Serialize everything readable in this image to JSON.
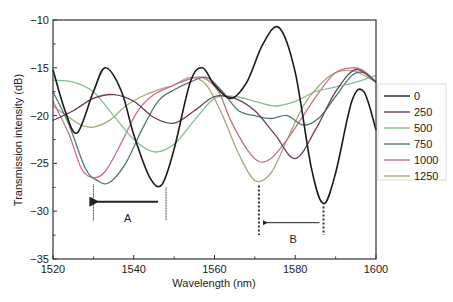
{
  "chart_data": {
    "type": "line",
    "title": "",
    "xlabel": "Wavelength (nm)",
    "ylabel": "Transmission intensity (dB)",
    "xlim": [
      1520,
      1600
    ],
    "ylim": [
      -35,
      -10
    ],
    "xticks": [
      1520,
      1540,
      1560,
      1580,
      1600
    ],
    "yticks": [
      -35,
      -30,
      -25,
      -20,
      -15,
      -10
    ],
    "grid": false,
    "legend_position": "right-outside",
    "series": [
      {
        "name": "0",
        "color": "#1a1a1a",
        "x": [
          1520,
          1523,
          1526,
          1530,
          1533,
          1537,
          1540,
          1544,
          1547,
          1550,
          1554,
          1557,
          1560,
          1564,
          1568,
          1572,
          1576,
          1580,
          1584,
          1587,
          1590,
          1594,
          1597,
          1600
        ],
        "y": [
          -15.2,
          -19.5,
          -21.8,
          -17.5,
          -15.0,
          -17.5,
          -22.0,
          -26.5,
          -27.2,
          -23.5,
          -16.5,
          -15.0,
          -16.8,
          -18.2,
          -16.5,
          -12.5,
          -10.8,
          -15.5,
          -25.5,
          -29.2,
          -26.0,
          -18.5,
          -17.5,
          -21.5
        ]
      },
      {
        "name": "250",
        "color": "#6b3a5c",
        "x": [
          1520,
          1525,
          1530,
          1535,
          1540,
          1545,
          1550,
          1555,
          1560,
          1565,
          1570,
          1575,
          1580,
          1585,
          1590,
          1595,
          1600
        ],
        "y": [
          -20.5,
          -19.5,
          -18.2,
          -17.8,
          -18.5,
          -20.2,
          -20.8,
          -19.5,
          -18.0,
          -18.2,
          -19.5,
          -22.0,
          -24.5,
          -21.5,
          -17.5,
          -15.2,
          -16.5
        ]
      },
      {
        "name": "500",
        "color": "#7fc090",
        "x": [
          1520,
          1525,
          1530,
          1535,
          1540,
          1545,
          1550,
          1555,
          1560,
          1565,
          1570,
          1575,
          1580,
          1585,
          1590,
          1595,
          1600
        ],
        "y": [
          -16.3,
          -16.5,
          -17.5,
          -20.0,
          -22.5,
          -23.8,
          -23.0,
          -20.5,
          -18.2,
          -18.0,
          -18.5,
          -19.0,
          -18.5,
          -17.5,
          -17.0,
          -16.5,
          -15.8
        ]
      },
      {
        "name": "750",
        "color": "#4e7a72",
        "x": [
          1520,
          1524,
          1528,
          1531,
          1534,
          1538,
          1542,
          1546,
          1550,
          1554,
          1558,
          1562,
          1566,
          1570,
          1574,
          1578,
          1582,
          1586,
          1590,
          1594,
          1597,
          1600
        ],
        "y": [
          -17.5,
          -21.0,
          -25.5,
          -26.8,
          -27.0,
          -25.0,
          -21.5,
          -18.5,
          -17.3,
          -16.5,
          -16.0,
          -17.5,
          -19.5,
          -20.0,
          -20.3,
          -20.0,
          -21.0,
          -20.2,
          -18.0,
          -15.8,
          -15.5,
          -16.5
        ]
      },
      {
        "name": "1000",
        "color": "#c77090",
        "x": [
          1520,
          1524,
          1527,
          1530,
          1533,
          1537,
          1541,
          1545,
          1549,
          1553,
          1557,
          1561,
          1564,
          1568,
          1571,
          1574,
          1578,
          1582,
          1586,
          1590,
          1594,
          1597,
          1600
        ],
        "y": [
          -18.5,
          -22.0,
          -25.5,
          -26.5,
          -25.8,
          -22.8,
          -19.5,
          -17.8,
          -17.0,
          -16.3,
          -16.0,
          -17.5,
          -20.5,
          -23.5,
          -24.8,
          -24.5,
          -22.5,
          -20.0,
          -17.5,
          -15.5,
          -15.0,
          -15.3,
          -16.5
        ]
      },
      {
        "name": "1250",
        "color": "#a9a97c",
        "x": [
          1520,
          1524,
          1527,
          1530,
          1534,
          1538,
          1542,
          1546,
          1550,
          1554,
          1558,
          1562,
          1566,
          1570,
          1574,
          1578,
          1582,
          1586,
          1590,
          1594,
          1597,
          1600
        ],
        "y": [
          -19.0,
          -20.2,
          -21.0,
          -21.2,
          -20.5,
          -19.0,
          -18.0,
          -17.3,
          -16.8,
          -16.0,
          -16.8,
          -20.0,
          -24.0,
          -26.8,
          -26.0,
          -22.5,
          -19.0,
          -16.8,
          -15.5,
          -15.3,
          -15.8,
          -16.5
        ]
      }
    ],
    "annotations": [
      {
        "label": "A",
        "arrow_from_x": 1547,
        "arrow_to_x": 1530,
        "arrow_y": -29.0,
        "line_style": "solid",
        "markers": [
          {
            "x": 1530,
            "y_top": -27.2,
            "y_bottom": -31.0
          },
          {
            "x": 1548,
            "y_top": -27.5,
            "y_bottom": -31.0
          }
        ]
      },
      {
        "label": "B",
        "arrow_from_x": 1587,
        "arrow_to_x": 1572,
        "arrow_y": -31.2,
        "line_style": "dotted",
        "markers": [
          {
            "x": 1571,
            "y_top": -27.3,
            "y_bottom": -32.5
          },
          {
            "x": 1587,
            "y_top": -29.5,
            "y_bottom": -32.5
          }
        ]
      }
    ]
  }
}
